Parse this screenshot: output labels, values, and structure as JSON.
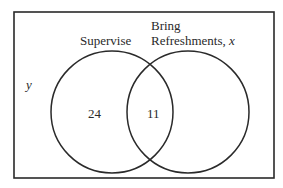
{
  "diagram": {
    "type": "venn",
    "universe_label": "y",
    "sets": [
      {
        "name": "Supervise",
        "label": "Supervise",
        "only_value": "24"
      },
      {
        "name": "Bring Refreshments",
        "label_line1": "Bring",
        "label_line2": "Refreshments,",
        "label_var": "x",
        "only_value": ""
      }
    ],
    "intersection_value": "11",
    "colors": {
      "stroke": "#2a2a2a",
      "background": "#ffffff",
      "text": "#2a2a2a"
    }
  }
}
